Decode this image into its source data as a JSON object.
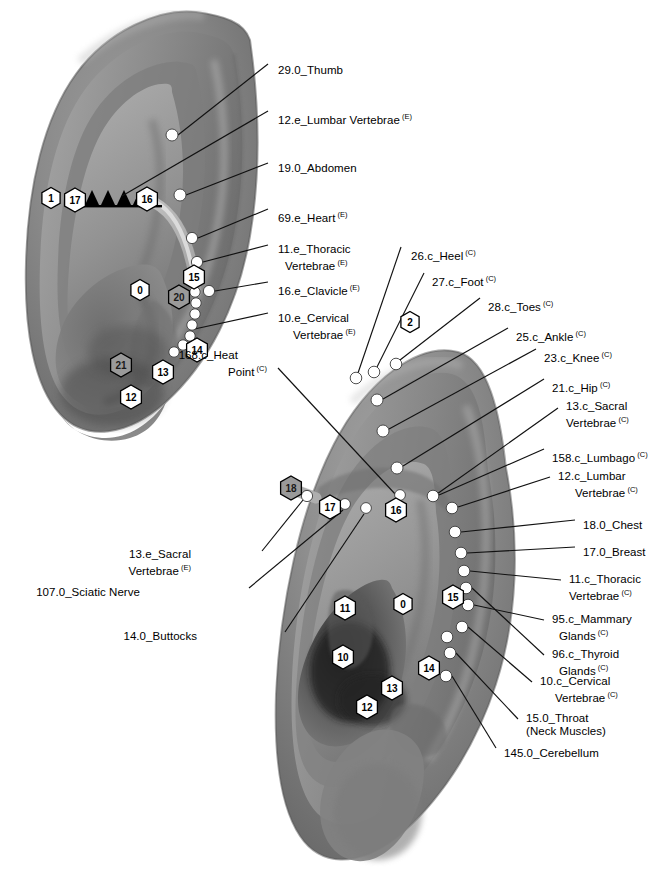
{
  "figure": {
    "kind": "auricular-acupuncture-point-map",
    "ears": [
      "upper-ear-left-view",
      "lower-ear-right-view"
    ],
    "colors": {
      "background": "#ffffff",
      "skin_mid": "#8a8a8a",
      "skin_light": "#b0b0b0",
      "skin_dark": "#5e5e5e",
      "skin_shadow": "#3a3a3a",
      "point_fill": "#ffffff",
      "point_stroke": "#3c3c3c",
      "leader_line": "#111111",
      "hex_fill": "#ffffff",
      "hex_fill_gray": "#9a9a9a",
      "hex_stroke": "#000000",
      "helix_band": "#c9c9c9",
      "sawtooth": "#000000"
    }
  },
  "upper_ear": {
    "labels": [
      {
        "id": "u1",
        "text": "29.0_Thumb",
        "sup": "",
        "x": 278,
        "y": 64
      },
      {
        "id": "u2",
        "text": "12.e_Lumbar Vertebrae",
        "sup": "(E)",
        "x": 278,
        "y": 110
      },
      {
        "id": "u3",
        "text": "19.0_Abdomen",
        "sup": "",
        "x": 278,
        "y": 162
      },
      {
        "id": "u4",
        "text": "69.e_Heart",
        "sup": "(E)",
        "x": 278,
        "y": 208
      },
      {
        "id": "u5a",
        "text": "11.e_Thoracic",
        "sup": "",
        "x": 278,
        "y": 243
      },
      {
        "id": "u5b",
        "text": "Vertebrae",
        "sup": "(E)",
        "x": 285,
        "y": 256
      },
      {
        "id": "u6",
        "text": "16.e_Clavicle",
        "sup": "(E)",
        "x": 278,
        "y": 281
      },
      {
        "id": "u7a",
        "text": "10.e_Cervical",
        "sup": "",
        "x": 278,
        "y": 312
      },
      {
        "id": "u7b",
        "text": "Vertebrae",
        "sup": "(E)",
        "x": 293,
        "y": 325
      }
    ],
    "hexagons": [
      {
        "label": "1",
        "x": 51,
        "y": 198,
        "style": "white"
      },
      {
        "label": "17",
        "x": 75,
        "y": 200,
        "style": "white"
      },
      {
        "label": "16",
        "x": 147,
        "y": 199,
        "style": "white"
      },
      {
        "label": "15",
        "x": 194,
        "y": 277,
        "style": "white"
      },
      {
        "label": "0",
        "x": 140,
        "y": 290,
        "style": "white"
      },
      {
        "label": "20",
        "x": 179,
        "y": 297,
        "style": "gray"
      },
      {
        "label": "14",
        "x": 197,
        "y": 350,
        "style": "white"
      },
      {
        "label": "21",
        "x": 121,
        "y": 365,
        "style": "gray"
      },
      {
        "label": "13",
        "x": 163,
        "y": 372,
        "style": "white"
      },
      {
        "label": "12",
        "x": 131,
        "y": 397,
        "style": "white"
      }
    ],
    "points": [
      {
        "name": "thumb",
        "x": 172,
        "y": 135,
        "r": 6.0
      },
      {
        "name": "abdomen",
        "x": 180,
        "y": 195,
        "r": 6.0
      },
      {
        "name": "heart",
        "x": 192,
        "y": 238,
        "r": 5.6
      },
      {
        "name": "thoracic-vertebrae",
        "x": 197,
        "y": 262,
        "r": 5.6
      },
      {
        "name": "clavicle",
        "x": 209,
        "y": 291,
        "r": 5.6
      },
      {
        "name": "cervical-c1",
        "x": 195,
        "y": 292,
        "r": 5.2
      },
      {
        "name": "cervical-c2",
        "x": 196,
        "y": 303,
        "r": 5.2
      },
      {
        "name": "cervical-c3",
        "x": 195,
        "y": 314,
        "r": 5.2
      },
      {
        "name": "cervical-c4",
        "x": 192,
        "y": 325,
        "r": 5.2
      },
      {
        "name": "cervical-c5",
        "x": 190,
        "y": 336,
        "r": 5.2
      },
      {
        "name": "cervical-c6",
        "x": 183,
        "y": 345,
        "r": 5.2
      },
      {
        "name": "cervical-c7",
        "x": 174,
        "y": 352,
        "r": 5.2
      }
    ],
    "sawtooth_count": 5
  },
  "lower_ear": {
    "labels_right": [
      {
        "id": "l1",
        "text": "26.c_Heel",
        "sup": "(C)",
        "x": 411,
        "y": 246
      },
      {
        "id": "l2",
        "text": "27.c_Foot",
        "sup": "(C)",
        "x": 432,
        "y": 272
      },
      {
        "id": "l3",
        "text": "28.c_Toes",
        "sup": "(C)",
        "x": 488,
        "y": 297
      },
      {
        "id": "l4",
        "text": "25.c_Ankle",
        "sup": "(C)",
        "x": 516,
        "y": 327
      },
      {
        "id": "l5",
        "text": "23.c_Knee",
        "sup": "(C)",
        "x": 544,
        "y": 348
      },
      {
        "id": "l6",
        "text": "21.c_Hip",
        "sup": "(C)",
        "x": 552,
        "y": 378
      },
      {
        "id": "l7a",
        "text": "13.c_Sacral",
        "sup": "",
        "x": 566,
        "y": 400
      },
      {
        "id": "l7b",
        "text": "Vertebrae",
        "sup": "(C)",
        "x": 566,
        "y": 413
      },
      {
        "id": "l8",
        "text": "158.c_Lumbago",
        "sup": "(C)",
        "x": 552,
        "y": 448
      },
      {
        "id": "l9a",
        "text": "12.c_Lumbar",
        "sup": "",
        "x": 558,
        "y": 470
      },
      {
        "id": "l9b",
        "text": "Vertebrae",
        "sup": "(C)",
        "x": 575,
        "y": 483
      },
      {
        "id": "l10",
        "text": "18.0_Chest",
        "sup": "",
        "x": 583,
        "y": 519
      },
      {
        "id": "l11",
        "text": "17.0_Breast",
        "sup": "",
        "x": 583,
        "y": 546
      },
      {
        "id": "l12a",
        "text": "11.c_Thoracic",
        "sup": "",
        "x": 569,
        "y": 573
      },
      {
        "id": "l12b",
        "text": "Vertebrae",
        "sup": "(C)",
        "x": 569,
        "y": 586
      },
      {
        "id": "l13a",
        "text": "95.c_Mammary",
        "sup": "",
        "x": 552,
        "y": 613
      },
      {
        "id": "l13b",
        "text": "Glands",
        "sup": "(C)",
        "x": 559,
        "y": 626
      },
      {
        "id": "l14a",
        "text": "96.c_Thyroid",
        "sup": "",
        "x": 552,
        "y": 648
      },
      {
        "id": "l14b",
        "text": "Glands",
        "sup": "(C)",
        "x": 559,
        "y": 661
      },
      {
        "id": "l15a",
        "text": "10.c_Cervical",
        "sup": "",
        "x": 540,
        "y": 675
      },
      {
        "id": "l15b",
        "text": "Vertebrae",
        "sup": "(C)",
        "x": 555,
        "y": 688
      },
      {
        "id": "l16a",
        "text": "15.0_Throat",
        "sup": "",
        "x": 526,
        "y": 712
      },
      {
        "id": "l16b",
        "text": "(Neck Muscles)",
        "sup": "",
        "x": 526,
        "y": 725
      },
      {
        "id": "l17",
        "text": "145.0_Cerebellum",
        "sup": "",
        "x": 504,
        "y": 747
      }
    ],
    "labels_left": [
      {
        "id": "ll0a",
        "text": "168.c_Heat",
        "sup": "",
        "x": 238,
        "y": 349
      },
      {
        "id": "ll0b",
        "text": "Point",
        "sup": "(C)",
        "x": 267,
        "y": 362
      },
      {
        "id": "ll1a",
        "text": "13.e_Sacral",
        "sup": "",
        "x": 191,
        "y": 548
      },
      {
        "id": "ll1b",
        "text": "Vertebrae",
        "sup": "(E)",
        "x": 191,
        "y": 561
      },
      {
        "id": "ll2",
        "text": "107.0_Sciatic Nerve",
        "sup": "",
        "x": 140,
        "y": 586
      },
      {
        "id": "ll3",
        "text": "14.0_Buttocks",
        "sup": "",
        "x": 197,
        "y": 630
      }
    ],
    "hexagons": [
      {
        "label": "18",
        "x": 291,
        "y": 488,
        "style": "gray"
      },
      {
        "label": "17",
        "x": 330,
        "y": 507,
        "style": "white"
      },
      {
        "label": "16",
        "x": 396,
        "y": 510,
        "style": "white"
      },
      {
        "label": "2",
        "x": 410,
        "y": 322,
        "style": "white"
      },
      {
        "label": "15",
        "x": 453,
        "y": 597,
        "style": "white"
      },
      {
        "label": "14",
        "x": 429,
        "y": 668,
        "style": "white"
      },
      {
        "label": "11",
        "x": 345,
        "y": 608,
        "style": "white"
      },
      {
        "label": "0",
        "x": 403,
        "y": 604,
        "style": "white"
      },
      {
        "label": "10",
        "x": 343,
        "y": 657,
        "style": "white"
      },
      {
        "label": "13",
        "x": 392,
        "y": 688,
        "style": "white"
      },
      {
        "label": "12",
        "x": 367,
        "y": 707,
        "style": "white"
      }
    ],
    "points": [
      {
        "name": "heel",
        "x": 356,
        "y": 378,
        "r": 5.8
      },
      {
        "name": "foot",
        "x": 374,
        "y": 372,
        "r": 5.8
      },
      {
        "name": "toes",
        "x": 396,
        "y": 364,
        "r": 5.8
      },
      {
        "name": "ankle",
        "x": 377,
        "y": 400,
        "r": 6.0
      },
      {
        "name": "knee",
        "x": 383,
        "y": 431,
        "r": 6.0
      },
      {
        "name": "hip",
        "x": 397,
        "y": 468,
        "r": 6.0
      },
      {
        "name": "sacral-vertebrae",
        "x": 307,
        "y": 496,
        "r": 5.6
      },
      {
        "name": "sciatic-nerve",
        "x": 345,
        "y": 504,
        "r": 5.4
      },
      {
        "name": "buttocks",
        "x": 366,
        "y": 508,
        "r": 5.4
      },
      {
        "name": "heat-point",
        "x": 400,
        "y": 495,
        "r": 5.4
      },
      {
        "name": "lumbago",
        "x": 433,
        "y": 496,
        "r": 5.8
      },
      {
        "name": "lumbar-vertebrae",
        "x": 452,
        "y": 508,
        "r": 5.8
      },
      {
        "name": "chest",
        "x": 455,
        "y": 532,
        "r": 5.8
      },
      {
        "name": "breast",
        "x": 461,
        "y": 553,
        "r": 5.8
      },
      {
        "name": "thoracic-t1",
        "x": 464,
        "y": 571,
        "r": 5.8
      },
      {
        "name": "thoracic-t2",
        "x": 466,
        "y": 588,
        "r": 5.8
      },
      {
        "name": "mammary-glands",
        "x": 468,
        "y": 605,
        "r": 5.8
      },
      {
        "name": "thyroid-glands",
        "x": 462,
        "y": 627,
        "r": 5.8
      },
      {
        "name": "cervical-c1",
        "x": 447,
        "y": 637,
        "r": 5.8
      },
      {
        "name": "throat",
        "x": 450,
        "y": 653,
        "r": 5.8
      },
      {
        "name": "cerebellum",
        "x": 446,
        "y": 676,
        "r": 5.8
      }
    ]
  },
  "leaders": {
    "upper": [
      {
        "name": "thumb-leader",
        "pts": "178,135 268,64"
      },
      {
        "name": "lumbar-leader",
        "pts": "122,196 268,111"
      },
      {
        "name": "abdomen-leader",
        "pts": "186,195 268,163"
      },
      {
        "name": "heart-leader",
        "pts": "198,238 268,209"
      },
      {
        "name": "thoracic-leader",
        "pts": "203,262 268,245"
      },
      {
        "name": "clavicle-leader",
        "pts": "215,291 268,282"
      },
      {
        "name": "cervical-leader",
        "pts": "190,330 268,313"
      }
    ],
    "lower": [
      {
        "name": "heel-leader",
        "pts": "358,373 401,247"
      },
      {
        "name": "foot-leader",
        "pts": "377,367 424,273"
      },
      {
        "name": "toes-leader",
        "pts": "400,360 480,298"
      },
      {
        "name": "ankle-leader",
        "pts": "383,399 508,328"
      },
      {
        "name": "knee-leader",
        "pts": "389,429 536,349"
      },
      {
        "name": "hip-leader",
        "pts": "403,466 544,379"
      },
      {
        "name": "sacral-c-leader",
        "pts": "437,494 558,408"
      },
      {
        "name": "lumbago-leader",
        "pts": "439,495 544,449"
      },
      {
        "name": "lumbar-c-leader",
        "pts": "458,507 550,477"
      },
      {
        "name": "chest-leader",
        "pts": "461,532 575,520"
      },
      {
        "name": "breast-leader",
        "pts": "467,553 575,547"
      },
      {
        "name": "thoracic-c-leader",
        "pts": "470,571 561,580"
      },
      {
        "name": "mammary-leader",
        "pts": "474,605 544,620"
      },
      {
        "name": "thyroid-leader",
        "pts": "472,588 544,655"
      },
      {
        "name": "cervical-c-leader",
        "pts": "468,627 532,682"
      },
      {
        "name": "throat-leader",
        "pts": "456,653 518,719"
      },
      {
        "name": "cerebellum-leader",
        "pts": "452,676 496,748"
      },
      {
        "name": "heat-point-leader",
        "pts": "396,495 278,368"
      },
      {
        "name": "sacral-e-leader",
        "pts": "303,500 262,551"
      },
      {
        "name": "sciatic-leader",
        "pts": "343,510 249,588"
      },
      {
        "name": "buttocks-leader",
        "pts": "364,514 285,632"
      }
    ]
  }
}
